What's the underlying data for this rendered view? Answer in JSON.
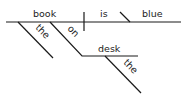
{
  "diagram": {
    "type": "sentence-diagram",
    "sentence": "the book on the desk is blue",
    "subject": "book",
    "verb": "is",
    "predicate_adjective": "blue",
    "modifiers": [
      {
        "word": "the",
        "modifies": "book"
      },
      {
        "word": "on",
        "modifies": "book",
        "role": "preposition"
      },
      {
        "word": "desk",
        "role": "object-of-preposition"
      },
      {
        "word": "the",
        "modifies": "desk"
      }
    ],
    "labels": {
      "subject": "book",
      "verb": "is",
      "complement": "blue",
      "article1": "the",
      "preposition": "on",
      "prep_object": "desk",
      "article2": "the"
    },
    "line_color": "#1a1a1a"
  }
}
